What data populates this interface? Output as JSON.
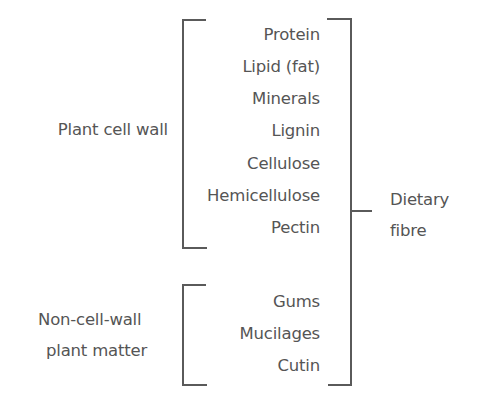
{
  "diagram": {
    "group_a": {
      "label": "Plant cell wall",
      "items": [
        "Protein",
        "Lipid (fat)",
        "Minerals",
        "Lignin",
        "Cellulose",
        "Hemicellulose",
        "Pectin"
      ]
    },
    "group_b": {
      "label_line1": "Non-cell-wall",
      "label_line2": "plant matter",
      "items": [
        "Gums",
        "Mucilages",
        "Cutin"
      ]
    },
    "outer": {
      "label_line1": "Dietary",
      "label_line2": "fibre"
    },
    "colors": {
      "text": "#555555",
      "lines": "#5a5a5a",
      "background": "#ffffff"
    }
  }
}
